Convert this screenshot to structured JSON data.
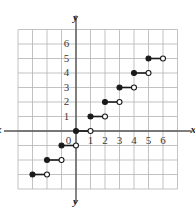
{
  "chart_data": {
    "type": "line",
    "title": "",
    "xlabel": "x",
    "ylabel": "y",
    "grid": true,
    "legend": false,
    "xlim": [
      -4,
      7
    ],
    "ylim": [
      -4,
      7
    ],
    "x_ticks": [
      0,
      1,
      2,
      3,
      4,
      5,
      6
    ],
    "y_ticks": [
      1,
      2,
      3,
      4,
      5,
      6
    ],
    "x_tick_labels": [
      "0",
      "1",
      "2",
      "3",
      "4",
      "5",
      "6"
    ],
    "y_tick_labels": [
      "1",
      "2",
      "3",
      "4",
      "5",
      "6"
    ],
    "series": [
      {
        "name": "step-function",
        "style": "step-segments",
        "segments": [
          {
            "x_start": -3,
            "x_end": -2,
            "y": -3,
            "left_endpoint": "closed",
            "right_endpoint": "open"
          },
          {
            "x_start": -2,
            "x_end": -1,
            "y": -2,
            "left_endpoint": "closed",
            "right_endpoint": "open"
          },
          {
            "x_start": -1,
            "x_end": 0,
            "y": -1,
            "left_endpoint": "closed",
            "right_endpoint": "open"
          },
          {
            "x_start": 0,
            "x_end": 1,
            "y": 0,
            "left_endpoint": "closed",
            "right_endpoint": "open"
          },
          {
            "x_start": 1,
            "x_end": 2,
            "y": 1,
            "left_endpoint": "closed",
            "right_endpoint": "open"
          },
          {
            "x_start": 2,
            "x_end": 3,
            "y": 2,
            "left_endpoint": "closed",
            "right_endpoint": "open"
          },
          {
            "x_start": 3,
            "x_end": 4,
            "y": 3,
            "left_endpoint": "closed",
            "right_endpoint": "open"
          },
          {
            "x_start": 4,
            "x_end": 5,
            "y": 4,
            "left_endpoint": "closed",
            "right_endpoint": "open"
          },
          {
            "x_start": 5,
            "x_end": 6,
            "y": 5,
            "left_endpoint": "closed",
            "right_endpoint": "open"
          }
        ]
      }
    ],
    "colors": {
      "grid": "#b4b4b4",
      "axis": "#555555",
      "curve": "#1a1a1a",
      "marker_fill": "#1a1a1a",
      "marker_open_fill": "#ffffff",
      "background": "#ffffff",
      "tick_text": "#3a3a3a",
      "axis_label_text": "#1a1a1a"
    }
  },
  "axis_labels": {
    "x_left": "x",
    "x_right": "x",
    "y_top": "y",
    "y_bottom": "y"
  }
}
